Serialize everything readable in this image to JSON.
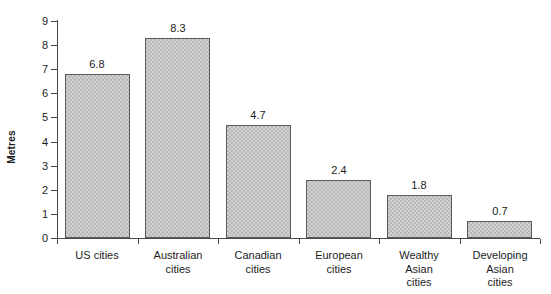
{
  "chart_data": {
    "type": "bar",
    "title": "",
    "subtitle": "",
    "xlabel": "",
    "ylabel": "Metres",
    "categories": [
      "US cities",
      "Australian cities",
      "Canadian cities",
      "European cities",
      "Wealthy Asian cities",
      "Developing Asian cities"
    ],
    "category_lines": [
      [
        "US cities"
      ],
      [
        "Australian",
        "cities"
      ],
      [
        "Canadian",
        "cities"
      ],
      [
        "European",
        "cities"
      ],
      [
        "Wealthy",
        "Asian",
        "cities"
      ],
      [
        "Developing",
        "Asian",
        "cities"
      ]
    ],
    "values": [
      6.8,
      8.3,
      4.7,
      2.4,
      1.8,
      0.7
    ],
    "value_labels": [
      "6.8",
      "8.3",
      "4.7",
      "2.4",
      "1.8",
      "0.7"
    ],
    "ylim": [
      0,
      9
    ],
    "ytick_labels": [
      "0",
      "1",
      "2",
      "3",
      "4",
      "5",
      "6",
      "7",
      "8",
      "9"
    ],
    "ytick_values": [
      0,
      1,
      2,
      3,
      4,
      5,
      6,
      7,
      8,
      9
    ],
    "grid": false,
    "legend": false,
    "legend_position": "none",
    "bar_fill_color": "#b8b8b8",
    "bar_edge_color": "#5a5a5a",
    "axis_color": "#4a4a4a",
    "text_color": "#1c1c1c",
    "background_color": "#ffffff"
  }
}
